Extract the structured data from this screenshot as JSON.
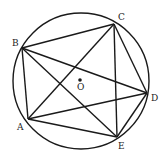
{
  "diagram": {
    "type": "circle-inscribed-pentagon-with-diagonals",
    "stroke_color": "#1a1a1a",
    "circle": {
      "cx": 81,
      "cy": 81,
      "r": 68,
      "center_label": "O",
      "center_dot": {
        "x": 80,
        "y": 80
      }
    },
    "points": [
      {
        "name": "A",
        "x": 28,
        "y": 119,
        "label_x": 17,
        "label_y": 130
      },
      {
        "name": "B",
        "x": 22,
        "y": 48,
        "label_x": 12,
        "label_y": 46
      },
      {
        "name": "C",
        "x": 114,
        "y": 24,
        "label_x": 118,
        "label_y": 20
      },
      {
        "name": "D",
        "x": 147,
        "y": 93,
        "label_x": 151,
        "label_y": 101
      },
      {
        "name": "E",
        "x": 117,
        "y": 137,
        "label_x": 118,
        "label_y": 149
      }
    ],
    "segments": [
      [
        "A",
        "B"
      ],
      [
        "B",
        "C"
      ],
      [
        "C",
        "D"
      ],
      [
        "D",
        "E"
      ],
      [
        "E",
        "A"
      ],
      [
        "A",
        "C"
      ],
      [
        "A",
        "D"
      ],
      [
        "B",
        "D"
      ],
      [
        "B",
        "E"
      ],
      [
        "C",
        "E"
      ]
    ],
    "labels": {
      "A": "A",
      "B": "B",
      "C": "C",
      "D": "D",
      "E": "E",
      "O": "O"
    }
  }
}
